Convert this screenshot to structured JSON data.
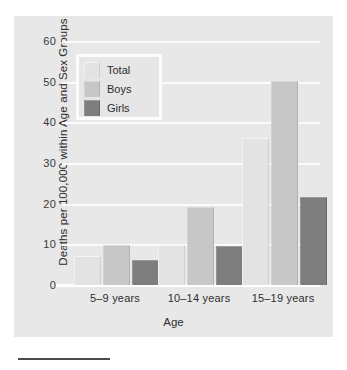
{
  "chart_data": {
    "type": "bar",
    "title": "",
    "xlabel": "Age",
    "ylabel": "Deaths per 100,000 within Age and Sex Groups",
    "categories": [
      "5–9 years",
      "10–14 years",
      "15–19 years"
    ],
    "series": [
      {
        "name": "Total",
        "values": [
          7,
          9.7,
          36
        ],
        "color": "#e3e3e3"
      },
      {
        "name": "Boys",
        "values": [
          9.5,
          19,
          50
        ],
        "color": "#c7c7c7"
      },
      {
        "name": "Girls",
        "values": [
          6,
          9.3,
          21.5
        ],
        "color": "#7e7e7e"
      }
    ],
    "ylim": [
      0,
      60
    ],
    "yticks": [
      0,
      10,
      20,
      30,
      40,
      50,
      60
    ],
    "ytick_labels": [
      "0",
      "10",
      "20",
      "30",
      "40",
      "50",
      "60"
    ],
    "grid": true,
    "legend_position": "upper-left"
  },
  "figure": {
    "panel_background": "#e8e8e8",
    "gridline_color": "#fbfbfb",
    "axis_color": "#ffffff"
  },
  "legend": {
    "entries": [
      {
        "label": "Total"
      },
      {
        "label": "Boys"
      },
      {
        "label": "Girls"
      }
    ]
  },
  "caption": {
    "rule_color": "#4a4a4a"
  }
}
